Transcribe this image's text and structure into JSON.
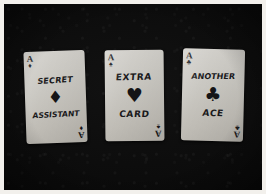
{
  "photo": {
    "subject": "three-handwritten-ace-playing-cards",
    "background_color": "#0a0a0a",
    "border_color": "#f2f0ec",
    "card_face_color": "#c9c7c1",
    "ink_color": "#1a1a1c"
  },
  "cards": [
    {
      "rank": "A",
      "index_suit_glyph": "♦",
      "center_pip_glyph": "♦",
      "suit_name": "diamonds",
      "text_top": "SECRET",
      "text_bottom": "ASSISTANT"
    },
    {
      "rank": "A",
      "index_suit_glyph": "♠",
      "center_pip_glyph": "♥",
      "suit_name": "hearts",
      "text_top": "EXTRA",
      "text_bottom": "CARD"
    },
    {
      "rank": "A",
      "index_suit_glyph": "♣",
      "center_pip_glyph": "♣",
      "suit_name": "clubs",
      "text_top": "ANOTHER",
      "text_bottom": "ACE"
    }
  ]
}
